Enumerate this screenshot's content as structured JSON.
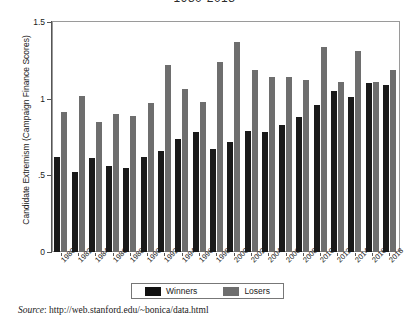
{
  "figure": {
    "title": "1980-2018",
    "source_prefix": "Source",
    "source_separator": ": ",
    "source_url": "http://web.stanford.edu/~bonica/data.html"
  },
  "legend": {
    "position": "bottom-center",
    "entries": [
      {
        "label": "Winners",
        "color": "#1a1a1a"
      },
      {
        "label": "Losers",
        "color": "#6e6e6e"
      }
    ]
  },
  "chart_data": {
    "type": "bar",
    "title": "1980-2018",
    "xlabel": "",
    "ylabel": "Candidate Extremism (Campaign Finance Scores)",
    "ylim": [
      0,
      1.5
    ],
    "yticks": [
      "0",
      ".5",
      "1",
      "1.5"
    ],
    "ytick_values": [
      0,
      0.5,
      1,
      1.5
    ],
    "grid": false,
    "categories": [
      "1980",
      "1982",
      "1984",
      "1986",
      "1988",
      "1990",
      "1992",
      "1994",
      "1996",
      "1998",
      "2000",
      "2002",
      "2004",
      "2006",
      "2008",
      "2010",
      "2012",
      "2014",
      "2016",
      "2018"
    ],
    "series": [
      {
        "name": "Winners",
        "color": "#1a1a1a",
        "values": [
          0.62,
          0.52,
          0.61,
          0.56,
          0.55,
          0.62,
          0.66,
          0.74,
          0.78,
          0.67,
          0.72,
          0.79,
          0.78,
          0.83,
          0.88,
          0.96,
          1.05,
          1.01,
          1.1,
          1.09
        ]
      },
      {
        "name": "Losers",
        "color": "#6e6e6e",
        "values": [
          0.91,
          1.02,
          0.85,
          0.9,
          0.89,
          0.97,
          1.22,
          1.06,
          0.98,
          1.24,
          1.37,
          1.19,
          1.14,
          1.14,
          1.12,
          1.34,
          1.11,
          1.31,
          1.11,
          1.19
        ]
      }
    ]
  }
}
